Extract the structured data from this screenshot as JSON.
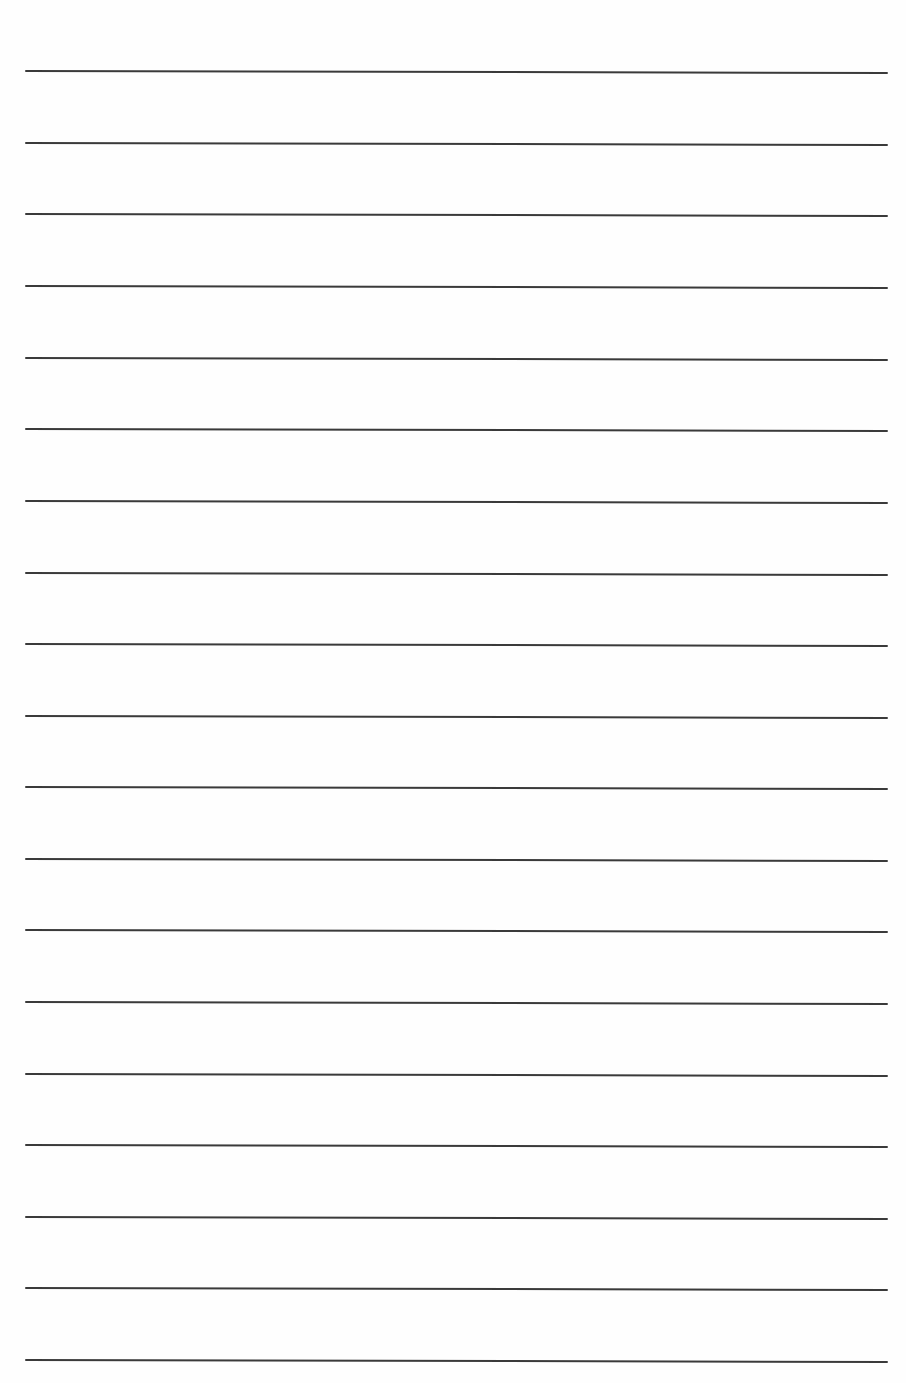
{
  "page": {
    "type": "ruled-paper",
    "background_color": "#fefefe",
    "line_color": "#3a3a3a",
    "line_count": 19,
    "line_left_x": 25,
    "line_right_x": 888,
    "line_thickness": 2,
    "line_slope_px": 2,
    "line_y_positions": [
      71,
      143,
      214,
      286,
      358,
      429,
      501,
      573,
      644,
      716,
      787,
      859,
      930,
      1002,
      1074,
      1145,
      1217,
      1288,
      1360
    ]
  }
}
